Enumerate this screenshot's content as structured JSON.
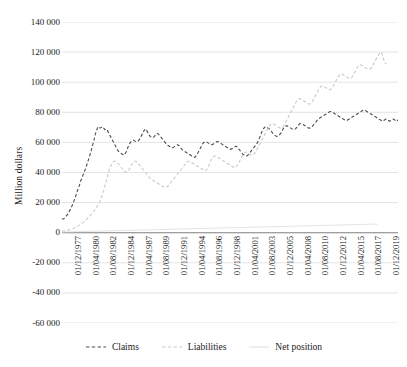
{
  "chart_data": {
    "type": "line",
    "title": "",
    "xlabel": "",
    "ylabel": "Million dollars",
    "ylim": [
      -60000,
      140000
    ],
    "ystep": 20000,
    "grid": true,
    "legend_position": "bottom",
    "ytick_labels": [
      "140 000",
      "120 000",
      "100 000",
      "80 000",
      "60 000",
      "40 000",
      "20 000",
      "0",
      "-20 000",
      "-40 000",
      "-60 000"
    ],
    "ytick_values": [
      140000,
      120000,
      100000,
      80000,
      60000,
      40000,
      20000,
      0,
      -20000,
      -40000,
      -60000
    ],
    "xtick_labels": [
      "01/12/1977",
      "01/04/1980",
      "01/08/1982",
      "01/12/1984",
      "01/04/1987",
      "01/08/1989",
      "01/12/1991",
      "01/04/1994",
      "01/08/1996",
      "01/12/1998",
      "01/04/2001",
      "01/08/2003",
      "01/12/2005",
      "01/04/2008",
      "01/08/2010",
      "01/12/2012",
      "01/04/2015",
      "01/08/2017",
      "01/12/2019"
    ],
    "colors": {
      "claims": "#4d4d4d",
      "liabilities": "#c9c9c9",
      "net_position": "#dcdcdc",
      "grid": "#d9d9d9",
      "axis": "#7f7f7f"
    },
    "series": [
      {
        "name": "Claims",
        "style": "dashed",
        "color": "#4d4d4d",
        "values": [
          9500,
          9000,
          9500,
          10500,
          11500,
          12500,
          14000,
          15500,
          17000,
          19000,
          21000,
          23000,
          25500,
          28000,
          30000,
          32500,
          35000,
          37000,
          39000,
          41000,
          43000,
          45500,
          48000,
          50500,
          53000,
          56000,
          59000,
          62000,
          65500,
          68000,
          70000,
          70500,
          69500,
          70000,
          70500,
          69500,
          68500,
          69000,
          68000,
          66500,
          65000,
          63500,
          62000,
          60500,
          59000,
          57500,
          56000,
          54500,
          53500,
          53000,
          52500,
          52000,
          51500,
          52500,
          54000,
          56000,
          58000,
          59500,
          60500,
          61000,
          61500,
          61000,
          60500,
          60500,
          61000,
          62000,
          63500,
          65000,
          66500,
          68000,
          69000,
          68000,
          66500,
          65000,
          64000,
          63500,
          63000,
          63500,
          64500,
          65500,
          66000,
          65500,
          64500,
          63500,
          62500,
          61500,
          60500,
          59500,
          58500,
          58000,
          57500,
          57000,
          56500,
          56500,
          57000,
          57500,
          58000,
          58500,
          58000,
          57000,
          56000,
          55000,
          54500,
          54000,
          53500,
          53000,
          52500,
          52000,
          51500,
          51000,
          50500,
          50000,
          50500,
          51500,
          53000,
          54500,
          56000,
          57500,
          59000,
          60000,
          60500,
          60500,
          60000,
          59500,
          59000,
          58500,
          58500,
          59000,
          59500,
          60000,
          60500,
          60500,
          60000,
          59500,
          59000,
          58500,
          58000,
          57500,
          57000,
          56500,
          56000,
          55500,
          55500,
          56000,
          56500,
          57000,
          57500,
          57000,
          56000,
          55000,
          54000,
          53000,
          52000,
          51500,
          51000,
          51000,
          51500,
          52500,
          53500,
          54500,
          55500,
          56500,
          57500,
          58500,
          60000,
          61500,
          63500,
          65500,
          67500,
          69000,
          70000,
          70500,
          70000,
          69500,
          69000,
          68000,
          67000,
          66000,
          65000,
          64500,
          64000,
          64000,
          64500,
          65500,
          66500,
          68000,
          69500,
          70500,
          71000,
          71000,
          70500,
          70000,
          69500,
          69000,
          68500,
          68500,
          69000,
          70000,
          71000,
          72000,
          72500,
          72500,
          72000,
          71500,
          71000,
          70500,
          70000,
          69500,
          69500,
          70000,
          70500,
          71500,
          72500,
          73500,
          74500,
          75500,
          76000,
          76500,
          77000,
          77500,
          78000,
          78500,
          79000,
          79500,
          80000,
          80500,
          80500,
          80000,
          79500,
          79000,
          78500,
          78000,
          77500,
          77000,
          76500,
          76000,
          75500,
          75000,
          74500,
          74500,
          75000,
          75500,
          76000,
          76500,
          77000,
          77500,
          78000,
          78500,
          79000,
          79500,
          80000,
          80500,
          81000,
          81500,
          81500,
          81000,
          80500,
          80000,
          79500,
          79000,
          78500,
          78000,
          77500,
          77000,
          76500,
          76000,
          75500,
          75000,
          74500,
          74000,
          74500,
          75000,
          75500,
          75000,
          74500,
          74000,
          74500,
          75000,
          75500,
          75000,
          74500,
          74000,
          75000
        ]
      },
      {
        "name": "Liabilities",
        "style": "dashed",
        "color": "#c9c9c9",
        "values": [
          1000,
          1100,
          1200,
          1300,
          1500,
          1700,
          1900,
          2100,
          2400,
          2700,
          3000,
          3400,
          3800,
          4200,
          4700,
          5200,
          5800,
          6400,
          7000,
          7700,
          8400,
          9200,
          10000,
          10800,
          11700,
          12600,
          13600,
          14600,
          15700,
          16800,
          18000,
          19500,
          21000,
          23000,
          25500,
          28000,
          31000,
          34000,
          37000,
          40000,
          42500,
          44500,
          46000,
          47000,
          47500,
          47500,
          47000,
          46000,
          45000,
          44000,
          43000,
          42000,
          41000,
          40500,
          40000,
          40500,
          41500,
          43000,
          44500,
          46000,
          47000,
          47500,
          47500,
          47000,
          46000,
          45000,
          44000,
          43000,
          42000,
          41000,
          40000,
          39000,
          38000,
          37000,
          36000,
          35500,
          35000,
          34500,
          34000,
          33500,
          33000,
          32500,
          32000,
          31500,
          31000,
          30500,
          30000,
          30000,
          30500,
          31000,
          32000,
          33000,
          34000,
          35000,
          36000,
          37000,
          38000,
          39000,
          40000,
          41000,
          42000,
          43000,
          44000,
          45000,
          46000,
          47000,
          47500,
          47500,
          47000,
          46500,
          46000,
          45500,
          45000,
          44500,
          44000,
          43500,
          43000,
          42500,
          42000,
          41500,
          41000,
          41500,
          42500,
          44000,
          46000,
          48000,
          49500,
          50500,
          51000,
          51000,
          50500,
          50000,
          49500,
          49000,
          48500,
          48000,
          47500,
          47000,
          46500,
          46000,
          45500,
          45000,
          44500,
          44000,
          43500,
          43000,
          43500,
          44500,
          46000,
          47500,
          49000,
          50500,
          52000,
          53000,
          53500,
          53500,
          53000,
          52500,
          52000,
          51500,
          51500,
          52000,
          53000,
          54500,
          56000,
          57500,
          59000,
          60500,
          62000,
          63500,
          65000,
          66500,
          68000,
          69500,
          71000,
          72000,
          72500,
          72500,
          72000,
          71500,
          71000,
          70500,
          70000,
          69500,
          69500,
          70000,
          71000,
          72500,
          74000,
          75500,
          77000,
          78500,
          80000,
          81500,
          83000,
          84500,
          86000,
          87500,
          88500,
          89000,
          89000,
          88500,
          88000,
          87500,
          87000,
          86500,
          86000,
          85500,
          85500,
          86000,
          87000,
          88500,
          90000,
          91500,
          93000,
          94500,
          96000,
          97000,
          97500,
          97500,
          97000,
          96500,
          96000,
          95500,
          95000,
          95000,
          95500,
          96500,
          98000,
          99500,
          101000,
          102500,
          104000,
          105000,
          105500,
          105500,
          105000,
          104500,
          104000,
          103500,
          103000,
          102500,
          102500,
          103000,
          104000,
          105500,
          107000,
          108500,
          110000,
          111000,
          111500,
          111500,
          111000,
          110500,
          110000,
          109500,
          109000,
          108500,
          108500,
          109000,
          110000,
          111500,
          113000,
          114500,
          116000,
          117500,
          118500,
          119500,
          120000,
          118000,
          115000,
          113000,
          112000
        ]
      },
      {
        "name": "Net position",
        "style": "solid",
        "color": "#dcdcdc",
        "values": [
          500,
          400,
          600,
          500,
          400,
          600,
          500,
          700,
          600,
          500,
          700,
          600,
          800,
          700,
          600,
          800,
          700,
          900,
          800,
          700,
          900,
          800,
          1000,
          900,
          800,
          1000,
          900,
          1100,
          1000,
          900,
          1100,
          1000,
          1200,
          1100,
          1000,
          1200,
          1100,
          1300,
          1200,
          1100,
          1300,
          1200,
          1400,
          1300,
          1200,
          1400,
          1300,
          1500,
          1400,
          1300,
          1500,
          1400,
          1600,
          1500,
          1400,
          1600,
          1500,
          1700,
          1600,
          1500,
          1700,
          1600,
          1800,
          1700,
          1600,
          1800,
          1700,
          1900,
          1800,
          1700,
          1900,
          1800,
          2000,
          1900,
          1800,
          2000,
          1900,
          2100,
          2000,
          1900,
          2100,
          2000,
          2200,
          2100,
          2000,
          2200,
          2100,
          2300,
          2200,
          2100,
          2300,
          2200,
          2400,
          2300,
          2200,
          2400,
          2300,
          2500,
          2400,
          2300,
          2500,
          2400,
          2600,
          2500,
          2400,
          2600,
          2500,
          2700,
          2600,
          2500,
          2700,
          2600,
          2800,
          2700,
          2600,
          2800,
          2700,
          2900,
          2800,
          2700,
          2900,
          2800,
          3000,
          2900,
          2800,
          3000,
          2900,
          3100,
          3000,
          2900,
          3100,
          3000,
          3200,
          3100,
          3000,
          3200,
          3100,
          3300,
          3200,
          3100,
          3300,
          3200,
          3400,
          3300,
          3200,
          3400,
          3300,
          3500,
          3400,
          3300,
          3500,
          3400,
          3600,
          3500,
          3400,
          3600,
          3500,
          3700,
          3600,
          3500,
          3700,
          3600,
          3800,
          3700,
          3600,
          3800,
          3700,
          3900,
          3800,
          3700,
          3900,
          3800,
          4000,
          3900,
          3800,
          4000,
          3900,
          4100,
          4000,
          3900,
          4100,
          4000,
          4200,
          4100,
          4000,
          4200,
          4100,
          4300,
          4200,
          4100,
          4300,
          4200,
          4400,
          4300,
          4200,
          4400,
          4300,
          4500,
          4400,
          4300,
          4500,
          4400,
          4600,
          4500,
          4400,
          4600,
          4500,
          4700,
          4600,
          4500,
          4700,
          4600,
          4800,
          4700,
          4600,
          4800,
          4700,
          4900,
          4800,
          4700,
          4900,
          4800,
          5000,
          4900,
          4800,
          5000,
          4900,
          5100,
          5000,
          4900,
          5100,
          5000,
          5200,
          5100,
          5000,
          5200,
          5100,
          5300,
          5200,
          5100,
          5300,
          5200,
          5400,
          5300,
          5200,
          5400,
          5300,
          5500,
          5400,
          5300,
          5500,
          5400,
          5600,
          5500,
          5400,
          5600,
          5500,
          5700,
          5600,
          5500,
          5700,
          5600,
          5800,
          5700,
          5600,
          5800
        ]
      }
    ]
  },
  "legend": {
    "items": [
      {
        "label": "Claims",
        "style": "dashed",
        "color": "#4d4d4d"
      },
      {
        "label": "Liabilities",
        "style": "dashed",
        "color": "#c9c9c9"
      },
      {
        "label": "Net position",
        "style": "solid",
        "color": "#dcdcdc"
      }
    ]
  }
}
